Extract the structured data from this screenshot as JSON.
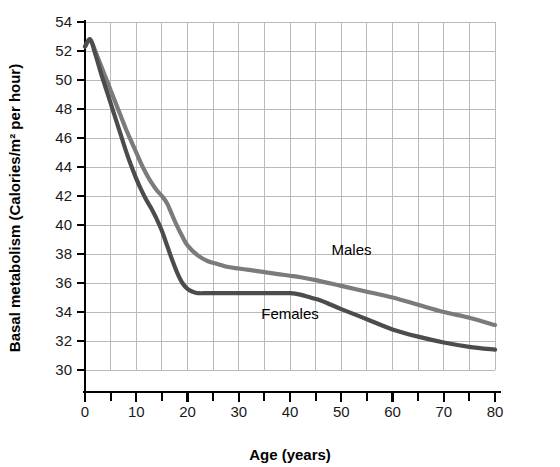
{
  "chart_data": {
    "type": "line",
    "title": "",
    "xlabel": "Age (years)",
    "ylabel": "Basal metabolism (Calories/m² per hour)",
    "xlim": [
      0,
      80
    ],
    "ylim": [
      30,
      54
    ],
    "x_ticks": [
      0,
      10,
      20,
      30,
      40,
      50,
      60,
      70,
      80
    ],
    "x_tick_labels": [
      "0",
      "10",
      "20",
      "30",
      "40",
      "50",
      "60",
      "70",
      "80"
    ],
    "x_minor_tick_step": 5,
    "y_ticks": [
      30,
      32,
      34,
      36,
      38,
      40,
      42,
      44,
      46,
      48,
      50,
      52,
      54
    ],
    "y_tick_labels": [
      "30",
      "32",
      "34",
      "36",
      "38",
      "40",
      "42",
      "44",
      "46",
      "48",
      "50",
      "52",
      "54"
    ],
    "grid": true,
    "grid_color": "#b9b9b9",
    "legend_position": "inline-annotations",
    "series": [
      {
        "name": "Males",
        "color": "#7b7b7b",
        "label_x": 52,
        "label_y": 37.9,
        "x": [
          0,
          1,
          2,
          3,
          4,
          5,
          6,
          7,
          8,
          9,
          10,
          11,
          12,
          13,
          14,
          15,
          16,
          17,
          18,
          19,
          20,
          22,
          24,
          26,
          28,
          30,
          32,
          34,
          36,
          38,
          40,
          42,
          45,
          50,
          55,
          60,
          65,
          70,
          75,
          80
        ],
        "y": [
          52.3,
          52.8,
          52.0,
          51.1,
          50.2,
          49.3,
          48.4,
          47.5,
          46.6,
          45.8,
          45.0,
          44.2,
          43.5,
          42.9,
          42.4,
          42.0,
          41.5,
          40.7,
          39.9,
          39.2,
          38.6,
          37.9,
          37.5,
          37.3,
          37.1,
          37.0,
          36.9,
          36.8,
          36.7,
          36.6,
          36.5,
          36.4,
          36.2,
          35.8,
          35.4,
          35.0,
          34.5,
          34.0,
          33.6,
          33.1
        ]
      },
      {
        "name": "Females",
        "color": "#4c4c4c",
        "label_x": 40,
        "label_y": 33.5,
        "x": [
          0,
          1,
          2,
          3,
          4,
          5,
          6,
          7,
          8,
          9,
          10,
          11,
          12,
          13,
          14,
          15,
          16,
          17,
          18,
          19,
          20,
          21,
          22,
          24,
          26,
          28,
          30,
          32,
          34,
          36,
          38,
          40,
          42,
          44,
          46,
          48,
          50,
          55,
          60,
          65,
          70,
          75,
          80
        ],
        "y": [
          52.3,
          52.8,
          51.8,
          50.6,
          49.5,
          48.4,
          47.3,
          46.2,
          45.1,
          44.1,
          43.2,
          42.4,
          41.7,
          41.1,
          40.4,
          39.6,
          38.6,
          37.6,
          36.7,
          36.0,
          35.6,
          35.4,
          35.3,
          35.3,
          35.3,
          35.3,
          35.3,
          35.3,
          35.3,
          35.3,
          35.3,
          35.3,
          35.2,
          35.0,
          34.8,
          34.5,
          34.2,
          33.5,
          32.8,
          32.3,
          31.9,
          31.6,
          31.4
        ]
      }
    ]
  },
  "annotations": {
    "males_label": "Males",
    "females_label": "Females"
  }
}
